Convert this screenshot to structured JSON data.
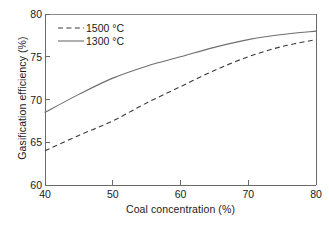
{
  "chart_data": {
    "type": "line",
    "title": "",
    "xlabel": "Coal concentration (%)",
    "ylabel": "Gasification efficiency (%)",
    "xlim": [
      40,
      80
    ],
    "ylim": [
      60,
      80
    ],
    "xticks": [
      40,
      50,
      60,
      70,
      80
    ],
    "yticks": [
      60,
      65,
      70,
      75,
      80
    ],
    "grid": false,
    "legend_position": "top-left inside",
    "x": [
      40,
      45,
      50,
      55,
      60,
      65,
      70,
      75,
      80
    ],
    "series": [
      {
        "name": "1500 °C",
        "style": "dashed",
        "color": "#3a3a3a",
        "values": [
          64.0,
          65.8,
          67.5,
          69.6,
          71.5,
          73.4,
          75.0,
          76.2,
          77.0
        ]
      },
      {
        "name": "1300 °C",
        "style": "solid",
        "color": "#6e6e6e",
        "values": [
          68.5,
          70.6,
          72.5,
          73.9,
          75.0,
          76.1,
          77.0,
          77.6,
          78.0
        ]
      }
    ]
  },
  "axes": {
    "y_tick_labels": [
      "80",
      "75",
      "70",
      "65",
      "60"
    ],
    "x_tick_labels": [
      "40",
      "50",
      "60",
      "70",
      "80"
    ],
    "y_title": "Gasification efficiency (%)",
    "x_title": "Coal concentration (%)"
  },
  "legend": {
    "entries": [
      {
        "label": "1500 °C",
        "style": "dashed"
      },
      {
        "label": "1300 °C",
        "style": "solid"
      }
    ]
  },
  "caption": {
    "fragment": ""
  }
}
